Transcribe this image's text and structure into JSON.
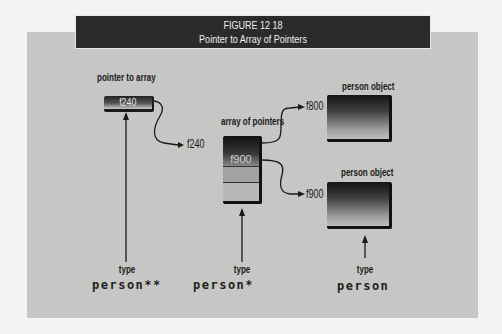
{
  "figure": {
    "number": "FIGURE 12 18",
    "title": "Pointer to Array of Pointers"
  },
  "pointer_to_array": {
    "label": "pointer to array",
    "value": "f240",
    "type_word": "type",
    "type": "person**"
  },
  "array_of_pointers": {
    "label": "array of pointers",
    "address": "f240",
    "first_cell": "f900",
    "type_word": "type",
    "type": "person*"
  },
  "person_objects": [
    {
      "label": "person object",
      "address": "f800"
    },
    {
      "label": "person object",
      "address": "f900"
    }
  ],
  "person_type": {
    "type_word": "type",
    "type": "person"
  },
  "colors": {
    "panel": "#c6c6c4",
    "titlebar": "#2b2b2b",
    "ink": "#1a1a1a"
  }
}
